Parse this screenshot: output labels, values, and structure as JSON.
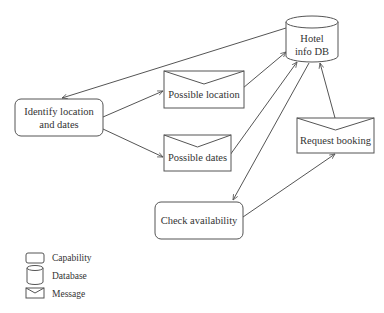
{
  "diagram": {
    "nodes": {
      "hotel_db": {
        "type": "database",
        "line1": "Hotel",
        "line2": "info DB"
      },
      "identify": {
        "type": "capability",
        "line1": "Identify location",
        "line2": "and dates"
      },
      "possible_location": {
        "type": "message",
        "label": "Possible location"
      },
      "possible_dates": {
        "type": "message",
        "label": "Possible dates"
      },
      "request_booking": {
        "type": "message",
        "label": "Request booking"
      },
      "check_availability": {
        "type": "capability",
        "label": "Check availability"
      }
    },
    "edges": [
      {
        "from": "hotel_db",
        "to": "identify"
      },
      {
        "from": "identify",
        "to": "possible_location"
      },
      {
        "from": "identify",
        "to": "possible_dates"
      },
      {
        "from": "possible_location",
        "to": "hotel_db"
      },
      {
        "from": "possible_dates",
        "to": "hotel_db"
      },
      {
        "from": "hotel_db",
        "to": "check_availability"
      },
      {
        "from": "check_availability",
        "to": "request_booking"
      },
      {
        "from": "request_booking",
        "to": "hotel_db"
      }
    ]
  },
  "legend": {
    "items": [
      {
        "icon": "capability-icon",
        "label": "Capability"
      },
      {
        "icon": "database-icon",
        "label": "Database"
      },
      {
        "icon": "message-icon",
        "label": "Message"
      }
    ]
  },
  "colors": {
    "stroke": "#555555",
    "text": "#333333",
    "background": "#ffffff"
  }
}
